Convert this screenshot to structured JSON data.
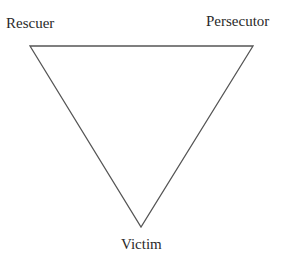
{
  "diagram": {
    "type": "triangle",
    "title": "",
    "nodes": [
      {
        "id": "rescuer",
        "label": "Rescuer",
        "position": "top-left"
      },
      {
        "id": "persecutor",
        "label": "Persecutor",
        "position": "top-right"
      },
      {
        "id": "victim",
        "label": "Victim",
        "position": "bottom"
      }
    ],
    "edges": [
      {
        "from": "rescuer",
        "to": "persecutor"
      },
      {
        "from": "persecutor",
        "to": "victim"
      },
      {
        "from": "victim",
        "to": "rescuer"
      }
    ],
    "line_color": "#555555"
  }
}
